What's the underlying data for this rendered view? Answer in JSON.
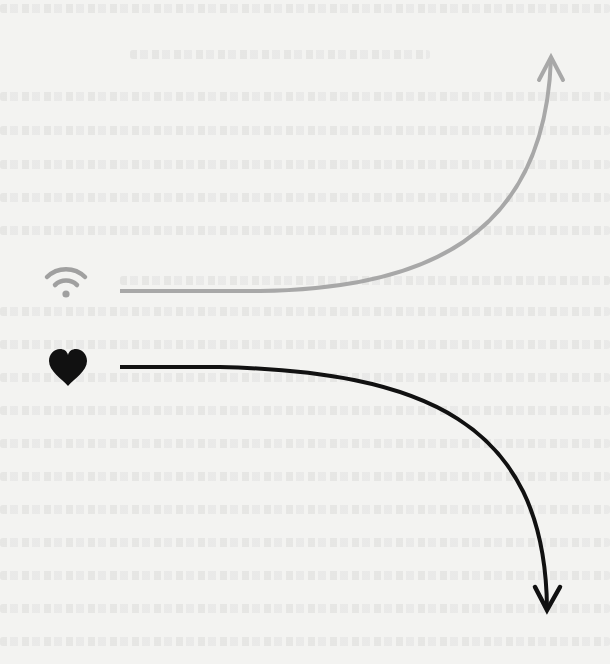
{
  "diagram": {
    "background_color": "#f3f3f1",
    "background_note": "faint illegible show-through text",
    "rows": [
      {
        "id": "wifi-row",
        "icon": "wifi-icon",
        "icon_color": "#a0a0a0",
        "icon_position": {
          "x": 66,
          "y": 287
        },
        "arrow": {
          "color": "#a8a8a8",
          "direction": "up",
          "stroke_width": 4,
          "start": {
            "x": 120,
            "y": 291
          },
          "end": {
            "x": 551,
            "y": 57
          }
        }
      },
      {
        "id": "heart-row",
        "icon": "heart-icon",
        "icon_color": "#111111",
        "icon_position": {
          "x": 68,
          "y": 368
        },
        "arrow": {
          "color": "#111111",
          "direction": "down",
          "stroke_width": 4,
          "start": {
            "x": 120,
            "y": 367
          },
          "end": {
            "x": 547,
            "y": 610
          }
        }
      }
    ]
  }
}
